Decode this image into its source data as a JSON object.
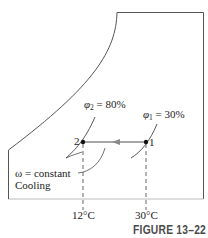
{
  "figure": {
    "caption": "FIGURE 13–22",
    "colors": {
      "frame": "#555555",
      "process_line": "#8a8a8a",
      "text": "#222222",
      "caption": "#4a4a4a"
    }
  },
  "states": [
    {
      "id": "1",
      "label": "1",
      "phi_symbol": "φ",
      "phi_sub": "1",
      "phi_value": "= 30%",
      "temperature": "30°C"
    },
    {
      "id": "2",
      "label": "2",
      "phi_symbol": "φ",
      "phi_sub": "2",
      "phi_value": "= 80%",
      "temperature": "12°C"
    }
  ],
  "annotation": {
    "line1": "ω = constant",
    "line2": "Cooling"
  }
}
